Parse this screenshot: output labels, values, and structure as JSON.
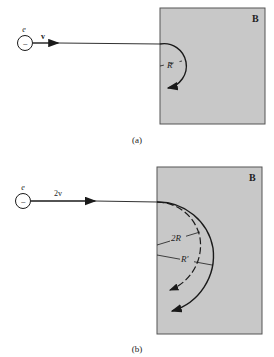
{
  "figure_a": {
    "particle_label": "e",
    "particle_sign": "−",
    "velocity_label": "v",
    "field_label": "B",
    "radius_label": "R",
    "caption": "(a)"
  },
  "figure_b": {
    "particle_label": "e",
    "particle_sign": "−",
    "velocity_label": "2v",
    "field_label": "B",
    "radius_label_dashed": "2R",
    "radius_label_solid": "R′",
    "caption": "(b)"
  },
  "colors": {
    "field_region": "#c8c8c8",
    "line": "#1a1a1a",
    "background": "#ffffff"
  }
}
